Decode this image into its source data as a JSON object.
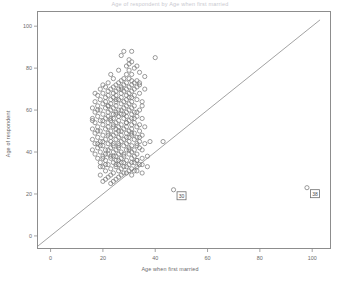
{
  "chart_data": {
    "type": "scatter",
    "title": "Age of respondent by Age when first married",
    "xlabel": "Age when first married",
    "ylabel": "Age of respondent",
    "xlim": [
      -5,
      107
    ],
    "ylim": [
      -6,
      107
    ],
    "xticks": [
      0,
      20,
      40,
      60,
      80,
      100
    ],
    "yticks": [
      0,
      20,
      40,
      60,
      80,
      100
    ],
    "xtick_labels": [
      "0",
      "20",
      "40",
      "60",
      "80",
      "100"
    ],
    "ytick_labels": [
      "0",
      "20",
      "40",
      "60",
      "80",
      "100"
    ],
    "grid": false,
    "legend": false,
    "marker": "open-circle",
    "marker_color": "#7a7a7a",
    "reference_line": {
      "name": "identity-line",
      "description": "y = x reference line",
      "x0": -5,
      "y0": -5,
      "x1": 103,
      "y1": 103,
      "color": "#8a8a8a"
    },
    "series": [
      {
        "name": "respondents",
        "points": [
          [
            28,
            88
          ],
          [
            31,
            88
          ],
          [
            27,
            86
          ],
          [
            40,
            85
          ],
          [
            31,
            83
          ],
          [
            30,
            82
          ],
          [
            29,
            81
          ],
          [
            33,
            81
          ],
          [
            32,
            80
          ],
          [
            26,
            79
          ],
          [
            30,
            79
          ],
          [
            34,
            78
          ],
          [
            23,
            77
          ],
          [
            29,
            77
          ],
          [
            31,
            77
          ],
          [
            36,
            76
          ],
          [
            24,
            75
          ],
          [
            28,
            75
          ],
          [
            30,
            75
          ],
          [
            27,
            74
          ],
          [
            31,
            74
          ],
          [
            33,
            74
          ],
          [
            22,
            73
          ],
          [
            26,
            73
          ],
          [
            29,
            73
          ],
          [
            32,
            73
          ],
          [
            20,
            72
          ],
          [
            25,
            72
          ],
          [
            28,
            72
          ],
          [
            31,
            72
          ],
          [
            34,
            72
          ],
          [
            21,
            71
          ],
          [
            24,
            71
          ],
          [
            27,
            71
          ],
          [
            30,
            71
          ],
          [
            33,
            71
          ],
          [
            19,
            70
          ],
          [
            23,
            70
          ],
          [
            26,
            70
          ],
          [
            29,
            70
          ],
          [
            32,
            70
          ],
          [
            36,
            70
          ],
          [
            22,
            69
          ],
          [
            25,
            69
          ],
          [
            28,
            69
          ],
          [
            31,
            69
          ],
          [
            20,
            68
          ],
          [
            24,
            68
          ],
          [
            27,
            68
          ],
          [
            30,
            68
          ],
          [
            34,
            68
          ],
          [
            18,
            67
          ],
          [
            22,
            67
          ],
          [
            25,
            67
          ],
          [
            29,
            67
          ],
          [
            32,
            67
          ],
          [
            21,
            66
          ],
          [
            24,
            66
          ],
          [
            27,
            66
          ],
          [
            31,
            66
          ],
          [
            19,
            65
          ],
          [
            23,
            65
          ],
          [
            26,
            65
          ],
          [
            29,
            65
          ],
          [
            33,
            65
          ],
          [
            17,
            64
          ],
          [
            21,
            64
          ],
          [
            25,
            64
          ],
          [
            28,
            64
          ],
          [
            31,
            64
          ],
          [
            35,
            64
          ],
          [
            20,
            63
          ],
          [
            23,
            63
          ],
          [
            27,
            63
          ],
          [
            30,
            63
          ],
          [
            18,
            62
          ],
          [
            22,
            62
          ],
          [
            25,
            62
          ],
          [
            29,
            62
          ],
          [
            32,
            62
          ],
          [
            16,
            61
          ],
          [
            21,
            61
          ],
          [
            24,
            61
          ],
          [
            28,
            61
          ],
          [
            31,
            61
          ],
          [
            19,
            60
          ],
          [
            23,
            60
          ],
          [
            26,
            60
          ],
          [
            30,
            60
          ],
          [
            34,
            60
          ],
          [
            17,
            59
          ],
          [
            22,
            59
          ],
          [
            25,
            59
          ],
          [
            29,
            59
          ],
          [
            32,
            59
          ],
          [
            20,
            58
          ],
          [
            24,
            58
          ],
          [
            27,
            58
          ],
          [
            31,
            58
          ],
          [
            18,
            57
          ],
          [
            22,
            57
          ],
          [
            26,
            57
          ],
          [
            29,
            57
          ],
          [
            33,
            57
          ],
          [
            16,
            56
          ],
          [
            21,
            56
          ],
          [
            24,
            56
          ],
          [
            28,
            56
          ],
          [
            31,
            56
          ],
          [
            35,
            56
          ],
          [
            19,
            55
          ],
          [
            23,
            55
          ],
          [
            26,
            55
          ],
          [
            30,
            55
          ],
          [
            17,
            54
          ],
          [
            22,
            54
          ],
          [
            25,
            54
          ],
          [
            29,
            54
          ],
          [
            32,
            54
          ],
          [
            20,
            53
          ],
          [
            24,
            53
          ],
          [
            27,
            53
          ],
          [
            31,
            53
          ],
          [
            34,
            53
          ],
          [
            18,
            52
          ],
          [
            22,
            52
          ],
          [
            26,
            52
          ],
          [
            29,
            52
          ],
          [
            33,
            52
          ],
          [
            16,
            51
          ],
          [
            21,
            51
          ],
          [
            25,
            51
          ],
          [
            28,
            51
          ],
          [
            31,
            51
          ],
          [
            19,
            50
          ],
          [
            23,
            50
          ],
          [
            27,
            50
          ],
          [
            30,
            50
          ],
          [
            34,
            50
          ],
          [
            17,
            49
          ],
          [
            22,
            49
          ],
          [
            25,
            49
          ],
          [
            29,
            49
          ],
          [
            32,
            49
          ],
          [
            20,
            48
          ],
          [
            24,
            48
          ],
          [
            27,
            48
          ],
          [
            31,
            48
          ],
          [
            35,
            48
          ],
          [
            18,
            47
          ],
          [
            23,
            47
          ],
          [
            26,
            47
          ],
          [
            30,
            47
          ],
          [
            33,
            47
          ],
          [
            16,
            46
          ],
          [
            21,
            46
          ],
          [
            25,
            46
          ],
          [
            28,
            46
          ],
          [
            32,
            46
          ],
          [
            19,
            45
          ],
          [
            23,
            45
          ],
          [
            27,
            45
          ],
          [
            30,
            45
          ],
          [
            34,
            45
          ],
          [
            17,
            44
          ],
          [
            22,
            44
          ],
          [
            26,
            44
          ],
          [
            29,
            44
          ],
          [
            33,
            44
          ],
          [
            20,
            43
          ],
          [
            24,
            43
          ],
          [
            28,
            43
          ],
          [
            31,
            43
          ],
          [
            18,
            42
          ],
          [
            23,
            42
          ],
          [
            26,
            42
          ],
          [
            30,
            42
          ],
          [
            34,
            42
          ],
          [
            16,
            41
          ],
          [
            21,
            41
          ],
          [
            25,
            41
          ],
          [
            29,
            41
          ],
          [
            32,
            41
          ],
          [
            19,
            40
          ],
          [
            24,
            40
          ],
          [
            27,
            40
          ],
          [
            31,
            40
          ],
          [
            17,
            39
          ],
          [
            22,
            39
          ],
          [
            26,
            39
          ],
          [
            30,
            39
          ],
          [
            33,
            39
          ],
          [
            20,
            38
          ],
          [
            25,
            38
          ],
          [
            28,
            38
          ],
          [
            32,
            38
          ],
          [
            18,
            37
          ],
          [
            23,
            37
          ],
          [
            27,
            37
          ],
          [
            31,
            37
          ],
          [
            35,
            37
          ],
          [
            21,
            36
          ],
          [
            25,
            36
          ],
          [
            29,
            36
          ],
          [
            33,
            36
          ],
          [
            19,
            35
          ],
          [
            24,
            35
          ],
          [
            28,
            35
          ],
          [
            32,
            35
          ],
          [
            22,
            34
          ],
          [
            26,
            34
          ],
          [
            30,
            34
          ],
          [
            34,
            34
          ],
          [
            20,
            33
          ],
          [
            25,
            33
          ],
          [
            29,
            33
          ],
          [
            33,
            33
          ],
          [
            23,
            32
          ],
          [
            27,
            32
          ],
          [
            31,
            32
          ],
          [
            21,
            31
          ],
          [
            26,
            31
          ],
          [
            30,
            31
          ],
          [
            24,
            30
          ],
          [
            28,
            30
          ],
          [
            19,
            29
          ],
          [
            23,
            29
          ],
          [
            27,
            29
          ],
          [
            22,
            28
          ],
          [
            26,
            28
          ],
          [
            21,
            27
          ],
          [
            25,
            27
          ],
          [
            20,
            26
          ],
          [
            24,
            26
          ],
          [
            23,
            25
          ],
          [
            33,
            43
          ],
          [
            35,
            41
          ],
          [
            36,
            44
          ],
          [
            38,
            45
          ],
          [
            43,
            45
          ],
          [
            34,
            73
          ],
          [
            30,
            84
          ],
          [
            27,
            70
          ],
          [
            25,
            58
          ],
          [
            29,
            47
          ],
          [
            31,
            35
          ],
          [
            37,
            38
          ],
          [
            33,
            36
          ],
          [
            35,
            34
          ],
          [
            32,
            31
          ],
          [
            28,
            33
          ],
          [
            26,
            36
          ],
          [
            24,
            44
          ],
          [
            22,
            48
          ],
          [
            20,
            55
          ],
          [
            18,
            60
          ],
          [
            17,
            68
          ],
          [
            19,
            43
          ],
          [
            21,
            39
          ],
          [
            23,
            56
          ],
          [
            25,
            65
          ],
          [
            27,
            60
          ],
          [
            29,
            54
          ],
          [
            31,
            49
          ],
          [
            33,
            59
          ],
          [
            35,
            62
          ],
          [
            30,
            66
          ],
          [
            28,
            58
          ],
          [
            26,
            50
          ],
          [
            24,
            52
          ],
          [
            22,
            62
          ],
          [
            20,
            45
          ],
          [
            18,
            50
          ],
          [
            16,
            55
          ],
          [
            34,
            47
          ],
          [
            36,
            52
          ],
          [
            32,
            56
          ],
          [
            30,
            41
          ],
          [
            28,
            39
          ],
          [
            26,
            43
          ],
          [
            24,
            38
          ],
          [
            22,
            41
          ],
          [
            20,
            37
          ],
          [
            18,
            44
          ],
          [
            19,
            33
          ],
          [
            21,
            34
          ],
          [
            23,
            38
          ],
          [
            25,
            34
          ],
          [
            27,
            35
          ],
          [
            29,
            30
          ],
          [
            31,
            29
          ],
          [
            33,
            31
          ],
          [
            35,
            30
          ],
          [
            37,
            33
          ]
        ]
      }
    ],
    "labeled_points": [
      {
        "name": "outlier-low-x",
        "x": 47,
        "y": 22,
        "label": "30",
        "label_dx": 8,
        "label_dy": -6
      },
      {
        "name": "outlier-high-x",
        "x": 98,
        "y": 23,
        "label": "38",
        "label_dx": 8,
        "label_dy": -6
      }
    ]
  }
}
